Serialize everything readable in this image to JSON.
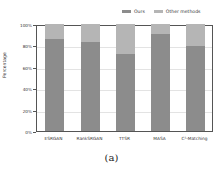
{
  "chart_data": {
    "type": "bar",
    "stacked": true,
    "normalized": true,
    "title": "",
    "xlabel": "",
    "ylabel": "Percentage",
    "ylim": [
      0,
      100
    ],
    "yticks": [
      "0%",
      "20%",
      "40%",
      "60%",
      "80%",
      "100%"
    ],
    "categories": [
      "ESRGAN",
      "RankSRGAN",
      "TTSR",
      "MASA",
      "C²-Matching"
    ],
    "series": [
      {
        "name": "Ours",
        "color": "#8c8c8c",
        "values": [
          86,
          83,
          72,
          91,
          79
        ]
      },
      {
        "name": "Other methods",
        "color": "#b5b5b5",
        "values": [
          14,
          17,
          28,
          9,
          21
        ]
      }
    ],
    "legend_position": "top-right",
    "grid": true,
    "caption": "(a)"
  },
  "legend": {
    "ours": "Ours",
    "other": "Other methods"
  },
  "caption": "(a)"
}
